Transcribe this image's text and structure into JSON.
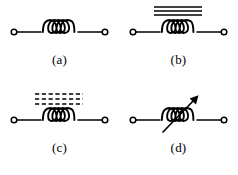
{
  "figure": {
    "background_color": "#ffffff",
    "stroke_color": "#000000",
    "panel_count": 4,
    "panels": [
      {
        "id": "a",
        "caption": "(a)",
        "symbol_name": "air-core-inductor",
        "description": "Inductor coil with four loops and two open circular terminals",
        "coil_loops": 4,
        "core_style": "none",
        "has_arrow": false
      },
      {
        "id": "b",
        "caption": "(b)",
        "symbol_name": "iron-core-inductor",
        "description": "Inductor coil with three solid parallel core lines above the coil",
        "coil_loops": 4,
        "core_style": "solid",
        "core_line_count": 3,
        "has_arrow": false
      },
      {
        "id": "c",
        "caption": "(c)",
        "symbol_name": "ferrite-core-inductor",
        "description": "Inductor coil with three dashed parallel core lines above the coil",
        "coil_loops": 4,
        "core_style": "dashed",
        "core_line_count": 3,
        "dashes_per_line": 6,
        "has_arrow": false
      },
      {
        "id": "d",
        "caption": "(d)",
        "symbol_name": "variable-inductor",
        "description": "Inductor coil with a diagonal arrow drawn across it from lower-left to upper-right",
        "coil_loops": 4,
        "core_style": "none",
        "has_arrow": true,
        "arrow_direction": "lower-left-to-upper-right"
      }
    ]
  }
}
